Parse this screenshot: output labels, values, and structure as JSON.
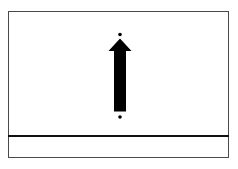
{
  "diagram": {
    "caption_remnant": "",
    "frame": {
      "border_color": "#4a4a4a",
      "divider_color": "#111111"
    },
    "arrow": {
      "direction": "up",
      "color": "#000000",
      "icon": "arrow-up-icon"
    },
    "markers": {
      "top_dot": "start-point-dot",
      "bottom_dot": "end-point-dot",
      "color": "#000000"
    },
    "lower_panel": {
      "text": ""
    }
  }
}
